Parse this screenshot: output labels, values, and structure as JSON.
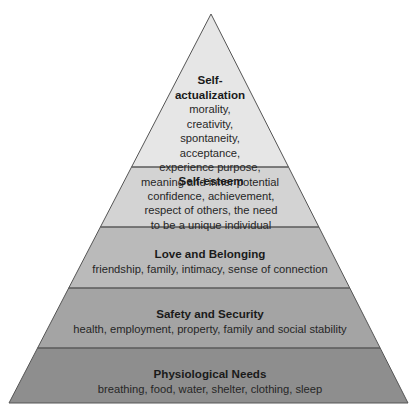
{
  "diagram": {
    "type": "pyramid",
    "colors": {
      "level_1": "#e6e6e6",
      "level_2": "#d3d3d3",
      "level_3": "#bababa",
      "level_4": "#a4a4a4",
      "level_5": "#8e8e8e",
      "outline": "#555555"
    },
    "levels": [
      {
        "title_line1": "Self-",
        "title_line2": "actualization",
        "desc_lines": [
          "morality,",
          "creativity,",
          "spontaneity,",
          "acceptance,",
          "experience purpose,",
          "meaning and inner potential"
        ]
      },
      {
        "title": "Self-esteem",
        "desc_lines": [
          "confidence, achievement,",
          "respect of others, the need",
          "to be a unique individual"
        ]
      },
      {
        "title": "Love and Belonging",
        "desc": "friendship, family, intimacy, sense of connection"
      },
      {
        "title": "Safety and Security",
        "desc": "health, employment, property, family and social stability"
      },
      {
        "title": "Physiological Needs",
        "desc": "breathing, food, water, shelter, clothing, sleep"
      }
    ]
  }
}
